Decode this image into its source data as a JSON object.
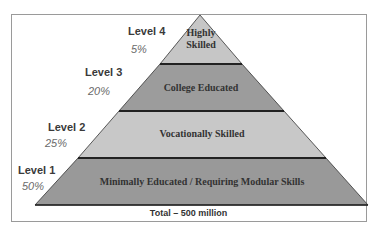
{
  "diagram": {
    "type": "pyramid",
    "levels": [
      {
        "level_label": "Level 4",
        "percent": "5%",
        "description_line1": "Highly",
        "description_line2": "Skilled",
        "fill": "#c6c6c6"
      },
      {
        "level_label": "Level 3",
        "percent": "20%",
        "description": "College Educated",
        "fill": "#9c9c9c"
      },
      {
        "level_label": "Level 2",
        "percent": "25%",
        "description": "Vocationally Skilled",
        "fill": "#c8c8c8"
      },
      {
        "level_label": "Level 1",
        "percent": "50%",
        "description": "Minimally Educated / Requiring Modular Skills",
        "fill": "#999999"
      }
    ],
    "total_label": "Total – 500 million",
    "colors": {
      "divider": "#222222",
      "frame": "#9a9a9a",
      "text": "#333333"
    }
  }
}
